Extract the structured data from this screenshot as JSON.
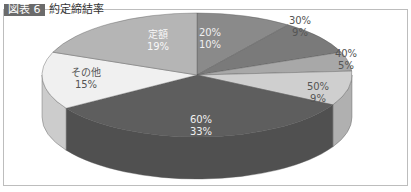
{
  "title": {
    "tag": "図表 6",
    "text": "約定締結率"
  },
  "chart_data": {
    "type": "pie",
    "style": "3d",
    "title": "図表 6 約定締結率",
    "categories": [
      "20%",
      "30%",
      "40%",
      "50%",
      "60%",
      "その他",
      "定額"
    ],
    "values": [
      10,
      9,
      5,
      9,
      33,
      15,
      19
    ],
    "labels": [
      {
        "name": "20%",
        "pct": "10%"
      },
      {
        "name": "30%",
        "pct": "9%"
      },
      {
        "name": "40%",
        "pct": "5%"
      },
      {
        "name": "50%",
        "pct": "9%"
      },
      {
        "name": "60%",
        "pct": "33%"
      },
      {
        "name": "その他",
        "pct": "15%"
      },
      {
        "name": "定額",
        "pct": "19%"
      }
    ],
    "colors": [
      "#8a8a8a",
      "#7a7a7a",
      "#a8a8a8",
      "#cfcfcf",
      "#5e5e5e",
      "#f0f0f0",
      "#b5b5b5"
    ],
    "start_angle": "top",
    "direction": "clockwise",
    "legend": "none"
  }
}
